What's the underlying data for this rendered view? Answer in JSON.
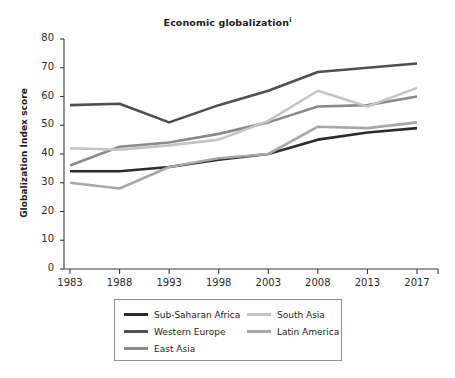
{
  "chart_data": {
    "type": "line",
    "title": "Economic globalization",
    "title_superscript": "i",
    "xlabel": "",
    "ylabel": "Globalization Index score",
    "categories": [
      "1983",
      "1988",
      "1993",
      "1998",
      "2003",
      "2008",
      "2013",
      "2017"
    ],
    "x": [
      1983,
      1988,
      1993,
      1998,
      2003,
      2008,
      2013,
      2017
    ],
    "ylim": [
      0,
      80
    ],
    "yticks": [
      0,
      10,
      20,
      30,
      40,
      50,
      60,
      70,
      80
    ],
    "grid": false,
    "legend_position": "bottom",
    "series": [
      {
        "name": "Sub-Saharan Africa",
        "color": "#2b2b2b",
        "values": [
          34,
          34,
          35.5,
          38,
          40,
          45,
          47.5,
          49
        ]
      },
      {
        "name": "Western Europe",
        "color": "#4f4f4f",
        "values": [
          57,
          57.5,
          51,
          57,
          62,
          68.5,
          70,
          71.5
        ]
      },
      {
        "name": "East Asia",
        "color": "#8a8a8a",
        "values": [
          36,
          42.5,
          44,
          47,
          51,
          56.5,
          57,
          60
        ]
      },
      {
        "name": "South Asia",
        "color": "#c4c4c4",
        "values": [
          42,
          41.5,
          43,
          45,
          51.5,
          62,
          56.5,
          63
        ]
      },
      {
        "name": "Latin America",
        "color": "#a8a8a8",
        "values": [
          30,
          28,
          35.5,
          38.5,
          40,
          49.5,
          49,
          51
        ]
      }
    ]
  },
  "legend": {
    "columns": [
      [
        "Sub-Saharan Africa",
        "Western Europe",
        "East Asia"
      ],
      [
        "South Asia",
        "Latin America"
      ]
    ]
  },
  "axis": {
    "y_tick_labels": [
      "80",
      "70",
      "60",
      "50",
      "40",
      "30",
      "20",
      "10",
      "0"
    ],
    "x_tick_labels": [
      "1983",
      "1988",
      "1993",
      "1998",
      "2003",
      "2008",
      "2013",
      "2017"
    ]
  },
  "colors": {
    "axis": "#3a3a3a",
    "text": "#1b1b1b",
    "legend_border": "#8e8e8e"
  }
}
